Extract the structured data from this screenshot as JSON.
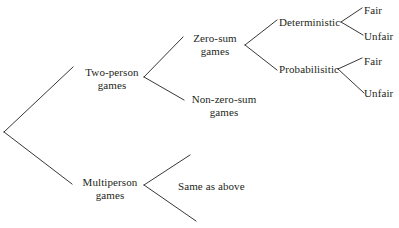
{
  "diagram": {
    "type": "tree",
    "background_color": "#ffffff",
    "line_color": "#231f20",
    "text_color": "#231f20",
    "nodes": [
      {
        "id": "root",
        "label": "",
        "lines": [],
        "x": 4,
        "y": 132,
        "level": 0
      },
      {
        "id": "two-person",
        "label": "Two-person games",
        "lines": [
          "Two-person",
          "games"
        ],
        "x": 112,
        "y": 72,
        "level": 1
      },
      {
        "id": "multiperson",
        "label": "Multiperson games",
        "lines": [
          "Multiperson",
          "games"
        ],
        "x": 110,
        "y": 182,
        "level": 1
      },
      {
        "id": "zero-sum",
        "label": "Zero-sum games",
        "lines": [
          "Zero-sum",
          "games"
        ],
        "x": 215,
        "y": 38,
        "level": 2
      },
      {
        "id": "non-zero-sum",
        "label": "Non-zero-sum games",
        "lines": [
          "Non-zero-sum",
          "games"
        ],
        "x": 224,
        "y": 99,
        "level": 2
      },
      {
        "id": "same-as-above",
        "label": "Same as above",
        "lines": [
          "Same as above"
        ],
        "x": 213,
        "y": 186,
        "level": 2
      },
      {
        "id": "deterministic",
        "label": "Deterministic",
        "lines": [
          "Deterministic"
        ],
        "x": 308,
        "y": 22,
        "level": 3
      },
      {
        "id": "probabilisitic",
        "label": "Probabilisitic",
        "lines": [
          "Probabilisitic"
        ],
        "x": 305,
        "y": 69,
        "level": 3
      },
      {
        "id": "fair-1",
        "label": "Fair",
        "lines": [
          "Fair"
        ],
        "x": 374,
        "y": 10,
        "level": 4
      },
      {
        "id": "unfair-1",
        "label": "Unfair",
        "lines": [
          "Unfair"
        ],
        "x": 377,
        "y": 36,
        "level": 4
      },
      {
        "id": "fair-2",
        "label": "Fair",
        "lines": [
          "Fair"
        ],
        "x": 374,
        "y": 61,
        "level": 4
      },
      {
        "id": "unfair-2",
        "label": "Unfair",
        "lines": [
          "Unfair"
        ],
        "x": 377,
        "y": 93,
        "level": 4
      }
    ],
    "edges": [
      {
        "from": "root",
        "to": "two-person",
        "x1": 4,
        "y1": 132,
        "x2": 73,
        "y2": 67
      },
      {
        "from": "root",
        "to": "multiperson",
        "x1": 4,
        "y1": 132,
        "x2": 72,
        "y2": 184
      },
      {
        "from": "two-person",
        "to": "zero-sum",
        "x1": 144,
        "y1": 77,
        "x2": 183,
        "y2": 37
      },
      {
        "from": "two-person",
        "to": "non-zero-sum",
        "x1": 144,
        "y1": 77,
        "x2": 184,
        "y2": 100
      },
      {
        "from": "zero-sum",
        "to": "deterministic",
        "x1": 245,
        "y1": 45,
        "x2": 277,
        "y2": 20
      },
      {
        "from": "zero-sum",
        "to": "probabilisitic",
        "x1": 245,
        "y1": 45,
        "x2": 277,
        "y2": 70
      },
      {
        "from": "deterministic",
        "to": "fair-1",
        "x1": 341,
        "y1": 22,
        "x2": 362,
        "y2": 8
      },
      {
        "from": "deterministic",
        "to": "unfair-1",
        "x1": 341,
        "y1": 22,
        "x2": 363,
        "y2": 35
      },
      {
        "from": "probabilisitic",
        "to": "fair-2",
        "x1": 338,
        "y1": 69,
        "x2": 362,
        "y2": 58
      },
      {
        "from": "probabilisitic",
        "to": "unfair-2",
        "x1": 338,
        "y1": 69,
        "x2": 364,
        "y2": 93
      },
      {
        "from": "multiperson",
        "to": "branch-up",
        "x1": 144,
        "y1": 185,
        "x2": 190,
        "y2": 155
      },
      {
        "from": "multiperson",
        "to": "branch-down",
        "x1": 144,
        "y1": 185,
        "x2": 196,
        "y2": 221
      }
    ]
  }
}
